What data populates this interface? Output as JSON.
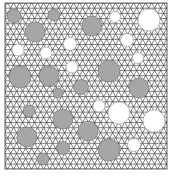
{
  "figure": {
    "colors": {
      "background": "#ffffff",
      "mesh_fill": "#ffffff",
      "mesh_line": "#4a4a4a",
      "inclusion_gray_fill": "#a6a6a6",
      "inclusion_gray_stroke": "#6e6e6e",
      "inclusion_white_fill": "#ffffff",
      "inclusion_white_stroke": "#9a9a9a",
      "border": "#3a3a3a"
    },
    "domain_box": {
      "x": 5,
      "y": 3,
      "width": 162,
      "height": 166
    },
    "mesh": {
      "type": "triangular",
      "spacing": 6
    },
    "inclusions": [
      {
        "cx": 14,
        "cy": 16,
        "r": 7,
        "type": "gray"
      },
      {
        "cx": 35,
        "cy": 32,
        "r": 10,
        "type": "gray"
      },
      {
        "cx": 54,
        "cy": 15,
        "r": 6,
        "type": "gray"
      },
      {
        "cx": 92,
        "cy": 26,
        "r": 10,
        "type": "gray"
      },
      {
        "cx": 115,
        "cy": 17,
        "r": 5.5,
        "type": "white"
      },
      {
        "cx": 149,
        "cy": 20,
        "r": 11,
        "type": "white"
      },
      {
        "cx": 127,
        "cy": 40,
        "r": 6.5,
        "type": "white"
      },
      {
        "cx": 70,
        "cy": 44,
        "r": 6.5,
        "type": "white"
      },
      {
        "cx": 18,
        "cy": 50,
        "r": 6,
        "type": "white"
      },
      {
        "cx": 46,
        "cy": 53,
        "r": 6,
        "type": "white"
      },
      {
        "cx": 138,
        "cy": 58,
        "r": 5.5,
        "type": "white"
      },
      {
        "cx": 72,
        "cy": 67,
        "r": 6,
        "type": "white"
      },
      {
        "cx": 20,
        "cy": 77,
        "r": 11,
        "type": "gray"
      },
      {
        "cx": 49,
        "cy": 76,
        "r": 10,
        "type": "gray"
      },
      {
        "cx": 109,
        "cy": 71,
        "r": 11,
        "type": "gray"
      },
      {
        "cx": 81,
        "cy": 87,
        "r": 7.5,
        "type": "gray"
      },
      {
        "cx": 139,
        "cy": 88,
        "r": 10,
        "type": "gray"
      },
      {
        "cx": 58,
        "cy": 93,
        "r": 5,
        "type": "gray"
      },
      {
        "cx": 29,
        "cy": 111,
        "r": 6,
        "type": "gray"
      },
      {
        "cx": 99,
        "cy": 106,
        "r": 6,
        "type": "white"
      },
      {
        "cx": 119,
        "cy": 113,
        "r": 11,
        "type": "white"
      },
      {
        "cx": 154,
        "cy": 121,
        "r": 11,
        "type": "white"
      },
      {
        "cx": 63,
        "cy": 119,
        "r": 10,
        "type": "gray"
      },
      {
        "cx": 27,
        "cy": 137,
        "r": 10,
        "type": "gray"
      },
      {
        "cx": 88,
        "cy": 131,
        "r": 10,
        "type": "gray"
      },
      {
        "cx": 63,
        "cy": 148,
        "r": 6.5,
        "type": "gray"
      },
      {
        "cx": 43,
        "cy": 159,
        "r": 6,
        "type": "gray"
      },
      {
        "cx": 109,
        "cy": 150,
        "r": 11,
        "type": "gray"
      },
      {
        "cx": 134,
        "cy": 145,
        "r": 6.5,
        "type": "white"
      }
    ]
  }
}
